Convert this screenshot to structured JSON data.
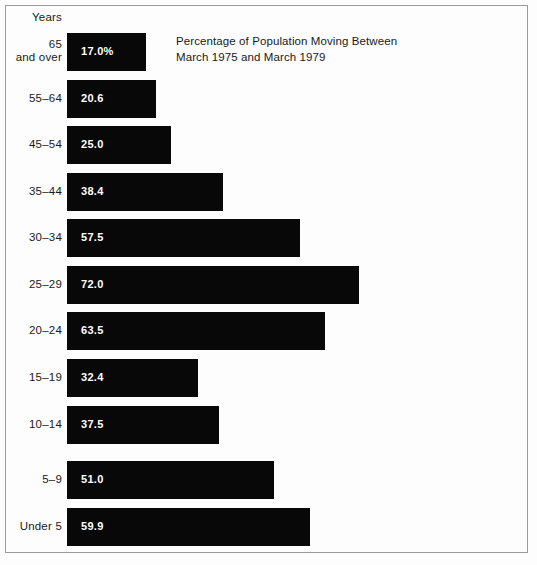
{
  "axis_header": "Years",
  "title_lines": [
    "Percentage of Population Moving Between",
    "March 1975 and March 1979"
  ],
  "colors": {
    "bar": "#080808",
    "background": "#fdfdfd",
    "frame": "#9a9a9a",
    "text": "#1a1a1a",
    "value_label": "#ffffff"
  },
  "chart_data": {
    "type": "bar",
    "orientation": "horizontal",
    "title": "Percentage of Population Moving Between March 1975 and March 1979",
    "xlabel": "",
    "ylabel": "Years",
    "grid": false,
    "legend": "none",
    "xlim": [
      0,
      72
    ],
    "axis_starts_at_zero": true,
    "px_per_unit": 4.05,
    "bar_origin_x_px": 67,
    "categories": [
      "65 and over",
      "55–64",
      "45–54",
      "35–44",
      "30–34",
      "25–29",
      "20–24",
      "15–19",
      "10–14",
      "5–9",
      "Under 5"
    ],
    "values": [
      17.0,
      20.6,
      25.0,
      38.4,
      57.5,
      72.0,
      63.5,
      32.4,
      37.5,
      51.0,
      59.9
    ],
    "data_labels": [
      "17.0%",
      "20.6",
      "25.0",
      "38.4",
      "57.5",
      "72.0",
      "63.5",
      "32.4",
      "37.5",
      "51.0",
      "59.9"
    ]
  },
  "bars": [
    {
      "label_line1": "65",
      "label_line2": "and over",
      "two_line": true,
      "value": 17.0,
      "value_label": "17.0%",
      "top": 33,
      "width": 79
    },
    {
      "label_line1": "55–64",
      "label_line2": "",
      "two_line": false,
      "value": 20.6,
      "value_label": "20.6",
      "top": 80,
      "width": 89
    },
    {
      "label_line1": "45–54",
      "label_line2": "",
      "two_line": false,
      "value": 25.0,
      "value_label": "25.0",
      "top": 126,
      "width": 104
    },
    {
      "label_line1": "35–44",
      "label_line2": "",
      "two_line": false,
      "value": 38.4,
      "value_label": "38.4",
      "top": 173,
      "width": 156
    },
    {
      "label_line1": "30–34",
      "label_line2": "",
      "two_line": false,
      "value": 57.5,
      "value_label": "57.5",
      "top": 219,
      "width": 233
    },
    {
      "label_line1": "25–29",
      "label_line2": "",
      "two_line": false,
      "value": 72.0,
      "value_label": "72.0",
      "top": 266,
      "width": 292
    },
    {
      "label_line1": "20–24",
      "label_line2": "",
      "two_line": false,
      "value": 63.5,
      "value_label": "63.5",
      "top": 312,
      "width": 258
    },
    {
      "label_line1": "15–19",
      "label_line2": "",
      "two_line": false,
      "value": 32.4,
      "value_label": "32.4",
      "top": 359,
      "width": 131
    },
    {
      "label_line1": "10–14",
      "label_line2": "",
      "two_line": false,
      "value": 37.5,
      "value_label": "37.5",
      "top": 406,
      "width": 152
    },
    {
      "label_line1": "5–9",
      "label_line2": "",
      "two_line": false,
      "value": 51.0,
      "value_label": "51.0",
      "top": 461,
      "width": 207
    },
    {
      "label_line1": "Under 5",
      "label_line2": "",
      "two_line": false,
      "value": 59.9,
      "value_label": "59.9",
      "top": 508,
      "width": 243
    }
  ]
}
